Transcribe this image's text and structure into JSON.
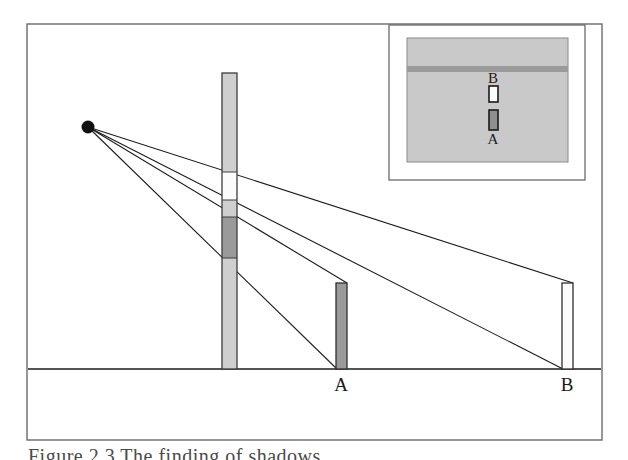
{
  "figure": {
    "kind": "ray-diagram",
    "caption": "Figure 2.3  The finding of shadows",
    "frame": {
      "name": "outer-figure-border",
      "x": 27,
      "y": 24,
      "width": 575,
      "height": 416,
      "stroke": "#6b6b6b",
      "stroke_width": 1.4,
      "fill": "#ffffff"
    },
    "ground": {
      "name": "ground-line",
      "y": 369,
      "x_start": 28,
      "x_end": 601,
      "stroke": "#1b1b1b",
      "stroke_width": 1.6
    },
    "light_source": {
      "label": "",
      "cx": 88,
      "cy": 127,
      "r": 6.5,
      "color": "#111111"
    },
    "occluder_bar": {
      "name": "central-occluder-bar",
      "x": 222,
      "y": 73,
      "width": 15,
      "height": 296,
      "body_fill": "#cfcfcf",
      "stroke": "#3c3c3c",
      "segments": [
        {
          "name": "segment-upper-light",
          "y": 73,
          "height": 99,
          "fill": "#cfcfcf"
        },
        {
          "name": "segment-white-band",
          "y": 172,
          "height": 28,
          "fill": "#fbfbfb"
        },
        {
          "name": "segment-mid-light",
          "y": 200,
          "height": 17,
          "fill": "#cfcfcf"
        },
        {
          "name": "segment-dark-band",
          "y": 217,
          "height": 41,
          "fill": "#9a9a9a"
        },
        {
          "name": "segment-lower-light",
          "y": 258,
          "height": 111,
          "fill": "#cfcfcf"
        }
      ]
    },
    "shadow_bars": [
      {
        "name": "shadow-bar-a",
        "label": "A",
        "x": 336,
        "y": 283,
        "width": 11,
        "height": 86,
        "fill": "#9a9a9a",
        "stroke": "#2e2e2e",
        "label_x": 341,
        "label_y": 391
      },
      {
        "name": "shadow-bar-b",
        "label": "B",
        "x": 562,
        "y": 283,
        "width": 11,
        "height": 86,
        "fill": "#fbfbfb",
        "stroke": "#2e2e2e",
        "label_x": 567,
        "label_y": 391
      }
    ],
    "rays": [
      {
        "name": "ray-1-top",
        "x1": 88,
        "y1": 127,
        "x2": 573,
        "y2": 283
      },
      {
        "name": "ray-2",
        "x1": 88,
        "y1": 127,
        "x2": 347,
        "y2": 283
      },
      {
        "name": "ray-3",
        "x1": 88,
        "y1": 127,
        "x2": 563,
        "y2": 369
      },
      {
        "name": "ray-4-bottom",
        "x1": 88,
        "y1": 127,
        "x2": 337,
        "y2": 369
      }
    ],
    "ray_stroke": "#1b1b1b",
    "ray_stroke_width": 1.1
  },
  "inset": {
    "name": "inset-panel",
    "frame": {
      "x": 389,
      "y": 25,
      "width": 196,
      "height": 155,
      "stroke": "#6b6b6b",
      "fill": "#ffffff"
    },
    "screen": {
      "name": "inset-screen",
      "x": 407,
      "y": 38,
      "width": 161,
      "height": 124,
      "fill": "#c9c9c9",
      "stroke": "#8a8a8a"
    },
    "band": {
      "name": "inset-horizontal-band",
      "x": 407,
      "y": 66,
      "width": 161,
      "height": 6,
      "fill": "#9a9a9a"
    },
    "patches": [
      {
        "name": "inset-patch-b",
        "label": "B",
        "x": 489,
        "y": 86,
        "width": 9,
        "height": 16,
        "fill": "#fbfbfb",
        "stroke": "#1b1b1b",
        "label_x": 493,
        "label_y": 83,
        "label_anchor": "middle"
      },
      {
        "name": "inset-patch-a",
        "label": "A",
        "x": 489,
        "y": 110,
        "width": 9,
        "height": 20,
        "fill": "#8f8f8f",
        "stroke": "#1b1b1b",
        "label_x": 493,
        "label_y": 144,
        "label_anchor": "middle"
      }
    ]
  },
  "colors": {
    "ink": "#1b1b1b",
    "frame_gray": "#6b6b6b",
    "light_gray": "#cfcfcf",
    "mid_gray": "#9a9a9a",
    "screen_gray": "#c9c9c9",
    "white": "#fbfbfb",
    "caption_gray": "#4a4a4a"
  }
}
